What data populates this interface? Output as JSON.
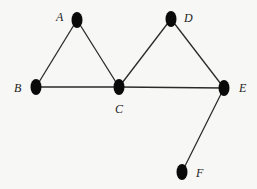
{
  "graph": {
    "nodes": [
      {
        "id": "A",
        "label": "A",
        "x": 77,
        "y": 20,
        "label_x": 56,
        "label_y": 11
      },
      {
        "id": "B",
        "label": "B",
        "x": 36,
        "y": 87,
        "label_x": 14,
        "label_y": 82
      },
      {
        "id": "C",
        "label": "C",
        "x": 119,
        "y": 87,
        "label_x": 115,
        "label_y": 103
      },
      {
        "id": "D",
        "label": "D",
        "x": 171,
        "y": 19,
        "label_x": 184,
        "label_y": 12
      },
      {
        "id": "E",
        "label": "E",
        "x": 224,
        "y": 88,
        "label_x": 239,
        "label_y": 82
      },
      {
        "id": "F",
        "label": "F",
        "x": 182,
        "y": 172,
        "label_x": 196,
        "label_y": 167
      }
    ],
    "edges": [
      [
        "A",
        "B"
      ],
      [
        "A",
        "C"
      ],
      [
        "B",
        "C"
      ],
      [
        "C",
        "D"
      ],
      [
        "D",
        "E"
      ],
      [
        "C",
        "E"
      ],
      [
        "E",
        "F"
      ]
    ],
    "colors": {
      "node": "#0a0a0a",
      "edge": "#2a2a2a",
      "background": "#f7f7f5"
    }
  },
  "labels": {
    "A": "A",
    "B": "B",
    "C": "C",
    "D": "D",
    "E": "E",
    "F": "F"
  }
}
